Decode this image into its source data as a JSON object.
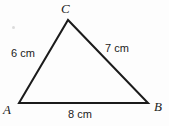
{
  "figure": {
    "type": "geometry-diagram",
    "shape": "triangle",
    "background_color": "#fdfdfd",
    "stroke_color": "#1b1b1b",
    "text_color": "#1b1b1b",
    "vertices": [
      {
        "name": "A",
        "label": "A",
        "x": 19,
        "y": 103
      },
      {
        "name": "B",
        "label": "B",
        "x": 148,
        "y": 103
      },
      {
        "name": "C",
        "label": "C",
        "x": 68,
        "y": 20
      }
    ],
    "sides": [
      {
        "name": "AC",
        "label": "6 cm",
        "value": 6,
        "unit": "cm"
      },
      {
        "name": "BC",
        "label": "7 cm",
        "value": 7,
        "unit": "cm"
      },
      {
        "name": "AB",
        "label": "8 cm",
        "value": 8,
        "unit": "cm"
      }
    ],
    "labels": {
      "vertex_a": "A",
      "vertex_b": "B",
      "vertex_c": "C",
      "side_ac": "6 cm",
      "side_bc": "7 cm",
      "side_ab": "8 cm"
    }
  }
}
